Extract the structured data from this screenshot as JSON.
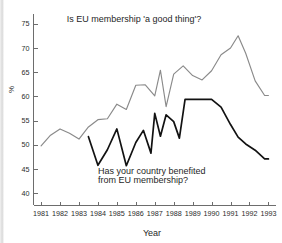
{
  "chart_data": {
    "type": "line",
    "title": "",
    "xlabel": "Year",
    "ylabel": "%",
    "xlim": [
      1980.6,
      1993.4
    ],
    "ylim": [
      37.5,
      77
    ],
    "yticks": [
      40,
      45,
      50,
      55,
      60,
      65,
      70,
      75
    ],
    "xticks": [
      1981,
      1982,
      1983,
      1984,
      1985,
      1986,
      1987,
      1988,
      1989,
      1990,
      1991,
      1992,
      1993
    ],
    "xtick_labels": [
      "1981",
      "1982",
      "1983",
      "1984",
      "1985",
      "1986",
      "1987",
      "1988",
      "1989",
      "1990",
      "1991",
      "1992",
      "1993"
    ],
    "ytick_labels": [
      "40",
      "45",
      "50",
      "55",
      "60",
      "65",
      "70",
      "75"
    ],
    "grid": false,
    "legend": "none",
    "annotations": [
      {
        "name": "good-thing-annotation",
        "text": "Is EU membership 'a good thing'?",
        "x": 1985.9,
        "y": 75.3
      },
      {
        "name": "benefited-annotation-line1",
        "text": "Has your country benefited",
        "x": 1984.0,
        "y": 44.0
      },
      {
        "name": "benefited-annotation-line2",
        "text": "from EU membership?",
        "x": 1984.0,
        "y": 42.1
      }
    ],
    "series": [
      {
        "name": "Is EU membership 'a good thing'?",
        "color": "#8a8a8a",
        "x": [
          1981.0,
          1981.5,
          1982.0,
          1982.5,
          1983.0,
          1983.5,
          1984.0,
          1984.5,
          1985.0,
          1985.5,
          1986.0,
          1986.5,
          1987.0,
          1987.3,
          1987.6,
          1988.0,
          1988.5,
          1989.0,
          1989.5,
          1990.0,
          1990.5,
          1991.0,
          1991.4,
          1991.8,
          1992.3,
          1992.8,
          1993.0
        ],
        "values": [
          49.8,
          52.0,
          53.3,
          52.4,
          51.2,
          53.7,
          55.2,
          55.4,
          58.4,
          57.3,
          62.3,
          62.4,
          60.1,
          65.4,
          57.9,
          64.6,
          66.3,
          64.3,
          63.4,
          65.3,
          68.6,
          70.0,
          72.5,
          68.9,
          63.2,
          60.2,
          60.2
        ]
      },
      {
        "name": "Has your country benefited from EU membership?",
        "color": "#121212",
        "x": [
          1983.5,
          1984.0,
          1984.5,
          1985.0,
          1985.5,
          1986.0,
          1986.4,
          1986.8,
          1987.0,
          1987.3,
          1987.6,
          1988.0,
          1988.3,
          1988.6,
          1989.0,
          1989.3,
          1989.6,
          1990.0,
          1990.5,
          1991.0,
          1991.4,
          1991.8,
          1992.3,
          1992.8,
          1993.0
        ],
        "values": [
          51.7,
          45.8,
          49.0,
          53.3,
          45.7,
          50.5,
          53.0,
          48.3,
          56.5,
          51.8,
          56.2,
          54.8,
          51.4,
          59.4,
          59.4,
          59.4,
          59.4,
          59.4,
          57.8,
          54.2,
          51.6,
          50.2,
          48.9,
          47.1,
          47.1
        ]
      }
    ]
  }
}
